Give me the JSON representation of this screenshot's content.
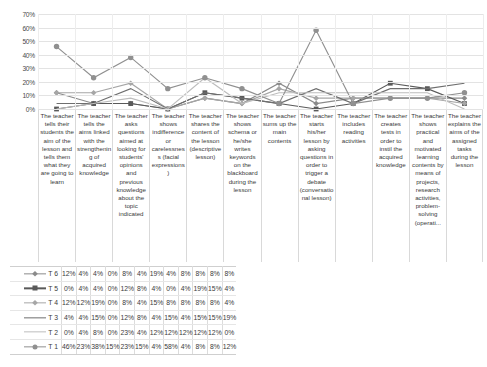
{
  "chart_data": {
    "type": "line",
    "title": "",
    "xlabel": "",
    "ylabel": "",
    "ylim": [
      0,
      70
    ],
    "yticks": [
      "0%",
      "10%",
      "20%",
      "30%",
      "40%",
      "50%",
      "60%",
      "70%"
    ],
    "grid": true,
    "legend_position": "table-left",
    "value_suffix": "%",
    "categories": [
      "The teacher tells their students the aim of the lesson and tells them what they are going to learn",
      "The teacher tells the aims linked with the strengthening of acquired knowledge",
      "The teacher asks questions aimed at looking for students' opinions and previous knowledge about the topic indicated",
      "The teacher shows indifference or carelessness (facial expressions)",
      "The teacher shares the content of the lesson (descriptive lesson)",
      "The teacher shows schema or he/she writes keywords on the blackboard during the lesson",
      "The teacher sums up the main contents",
      "The teacher starts his/her lesson by asking questions in order to trigger a debate (conversational lesson)",
      "The teacher includes reading activities",
      "The teacher creates tests in order to instil the acquired knowledge",
      "The teacher shows practical and motivated learning contents by means of projects, research activities, problem-solving (operati...",
      "The teacher explains the aims of the assigned tasks during the lesson"
    ],
    "series": [
      {
        "name": "T 6",
        "marker": "diamond",
        "color": "#8a8a8a",
        "values": [
          12,
          4,
          4,
          0,
          8,
          4,
          19,
          4,
          8,
          8,
          8,
          8
        ],
        "labels": [
          "12%",
          "4%",
          "4%",
          "0%",
          "8%",
          "4%",
          "19%",
          "4%",
          "8%",
          "8%",
          "8%",
          "8%"
        ]
      },
      {
        "name": "T 5",
        "marker": "square",
        "color": "#595959",
        "values": [
          0,
          4,
          4,
          0,
          12,
          8,
          4,
          0,
          4,
          19,
          15,
          4
        ],
        "labels": [
          "0%",
          "4%",
          "4%",
          "0%",
          "12%",
          "8%",
          "4%",
          "0%",
          "4%",
          "19%",
          "15%",
          "4%"
        ]
      },
      {
        "name": "T 4",
        "marker": "diamond",
        "color": "#a6a6a6",
        "values": [
          12,
          12,
          19,
          0,
          8,
          4,
          15,
          8,
          8,
          8,
          8,
          4
        ],
        "labels": [
          "12%",
          "12%",
          "19%",
          "0%",
          "8%",
          "4%",
          "15%",
          "8%",
          "8%",
          "8%",
          "8%",
          "4%"
        ]
      },
      {
        "name": "T 3",
        "marker": "none",
        "color": "#6e6e6e",
        "values": [
          4,
          4,
          15,
          0,
          12,
          8,
          4,
          15,
          4,
          15,
          15,
          19
        ],
        "labels": [
          "4%",
          "4%",
          "15%",
          "0%",
          "12%",
          "8%",
          "4%",
          "15%",
          "4%",
          "15%",
          "15%",
          "19%"
        ]
      },
      {
        "name": "T 2",
        "marker": "none",
        "color": "#bdbdbd",
        "values": [
          0,
          4,
          8,
          0,
          23,
          4,
          12,
          12,
          12,
          12,
          12,
          0
        ],
        "labels": [
          "0%",
          "4%",
          "8%",
          "0%",
          "23%",
          "4%",
          "12%",
          "12%",
          "12%",
          "12%",
          "12%",
          "0%"
        ]
      },
      {
        "name": "T 1",
        "marker": "circle",
        "color": "#909090",
        "values": [
          46,
          23,
          38,
          15,
          23,
          15,
          4,
          58,
          4,
          8,
          8,
          12
        ],
        "labels": [
          "46%",
          "23%",
          "38%",
          "15%",
          "23%",
          "15%",
          "4%",
          "58%",
          "4%",
          "8%",
          "8%",
          "12%"
        ]
      }
    ]
  }
}
